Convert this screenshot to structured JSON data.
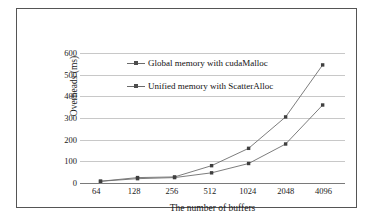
{
  "chart_data": {
    "type": "line",
    "title": "",
    "xlabel": "The number of buffers",
    "ylabel": "Overheads (ms)",
    "categories": [
      "64",
      "128",
      "256",
      "512",
      "1024",
      "2048",
      "4096"
    ],
    "series": [
      {
        "name": "Global memory with cudaMalloc",
        "values": [
          8,
          25,
          28,
          80,
          160,
          305,
          545
        ],
        "marker": "square",
        "color": "#4d4d4d"
      },
      {
        "name": "Unified memory with ScatterAlloc",
        "values": [
          8,
          20,
          25,
          47,
          90,
          180,
          360
        ],
        "marker": "square",
        "color": "#4d4d4d"
      }
    ],
    "yticks": [
      0,
      100,
      200,
      300,
      400,
      500,
      600
    ],
    "ylim": [
      0,
      600
    ],
    "grid": true,
    "legend_position": "inside-upper-left",
    "axis_color": "#7a7a7a",
    "grid_color": "#c8c8c8",
    "border_color": "#555555",
    "background": "#ffffff"
  },
  "legend": {
    "items": [
      {
        "label": "Global memory with cudaMalloc"
      },
      {
        "label": "Unified memory with ScatterAlloc"
      }
    ]
  }
}
